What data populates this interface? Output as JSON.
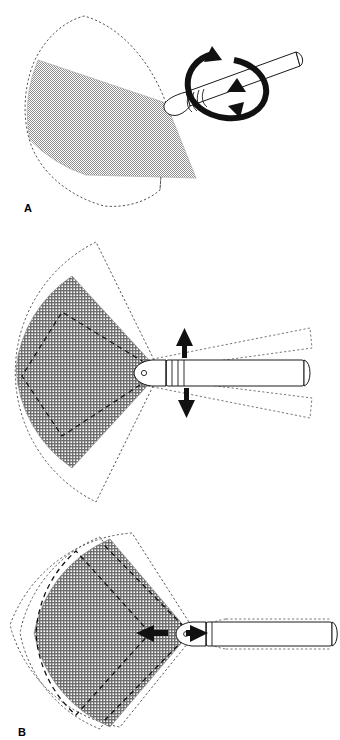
{
  "figure": {
    "background_color": "#ffffff",
    "ink_color": "#000000",
    "panel_count": 3
  },
  "panels": [
    {
      "id": "A",
      "label": "A",
      "motion": "rotation",
      "motion_icon": "circular-rotation-arrow",
      "probe_orientation": "oblique",
      "probe_label": "ultrasound-transducer",
      "arrow_count": 2,
      "scan_sector": {
        "fill": "#b9b9b9",
        "pattern": "fine-checker-dither",
        "apex_x": 166,
        "apex_y": 103,
        "sector_span_deg": 95,
        "radius": 150
      },
      "swept_outline": {
        "style": "dashed",
        "stroke": "#4a4a4a",
        "dash": "2 2"
      }
    },
    {
      "id": "B",
      "label": "B",
      "motion": "tilt",
      "motion_icon": "up-down-arrows",
      "probe_orientation": "horizontal",
      "probe_label": "ultrasound-transducer",
      "arrow_count": 2,
      "scan_sector": {
        "fill": "#9d9d9d",
        "pattern": "crosshatch-grid",
        "apex_x": 160,
        "apex_y": 372,
        "sector_span_deg": 110,
        "radius": 135
      },
      "swept_outline": {
        "style": "dashed",
        "stroke": "#4a4a4a",
        "dash": "2 2"
      }
    },
    {
      "id": "C",
      "label": "C",
      "motion": "translation",
      "motion_icon": "left-right-arrows",
      "probe_orientation": "horizontal",
      "probe_label": "ultrasound-transducer",
      "arrow_count": 2,
      "scan_sector": {
        "fill": "#9d9d9d",
        "pattern": "crosshatch-grid",
        "apex_x": 190,
        "apex_y": 633,
        "sector_span_deg": 120,
        "radius": 130
      },
      "swept_outline": {
        "style": "dashed",
        "stroke": "#4a4a4a",
        "dash": "2 2"
      }
    }
  ],
  "labels": {
    "a": "A",
    "b": "B",
    "c": "C"
  }
}
